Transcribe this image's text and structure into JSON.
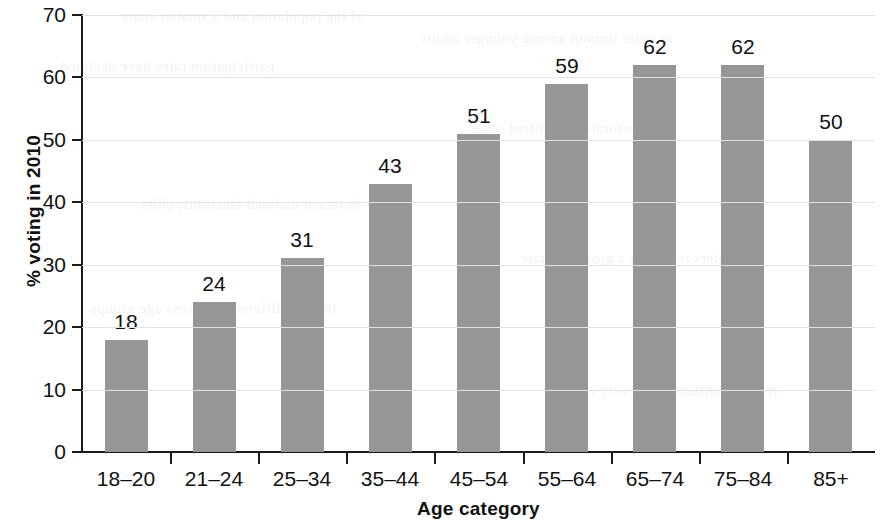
{
  "chart_data": {
    "type": "bar",
    "title": "",
    "subtitle": "",
    "xlabel": "Age category",
    "ylabel": "% voting in 2010",
    "categories": [
      "18–20",
      "21–24",
      "25–34",
      "35–44",
      "45–54",
      "55–64",
      "65–74",
      "75–84",
      "85+"
    ],
    "values": [
      18,
      24,
      31,
      43,
      51,
      59,
      62,
      62,
      50
    ],
    "data_labels": [
      "18",
      "24",
      "31",
      "43",
      "51",
      "59",
      "62",
      "62",
      "50"
    ],
    "ylim": [
      0,
      70
    ],
    "yticks": [
      0,
      10,
      20,
      30,
      40,
      50,
      60,
      70
    ],
    "ytick_labels": [
      "0",
      "10",
      "20",
      "30",
      "40",
      "50",
      "60",
      "70"
    ],
    "grid": true,
    "grid_axis": "y",
    "legend": false,
    "legend_position": "none",
    "bar_color": "#969696",
    "axis_color": "#1b1b1b",
    "gridline_color": "#e2e2e2",
    "text_color": "#111111",
    "background_color": "#ffffff"
  },
  "background_text": {
    "note": "faint show-through text from the reverse side of the scanned page",
    "lines": [
      "of the population and a smaller share",
      "in voter turnout among younger adults",
      "participation rates have declined",
      "the electorate has shifted older",
      "in recent national elections, older",
      "voters represent a growing share",
      "turnout differences across age groups",
      "remain substantial in every cycle"
    ]
  }
}
